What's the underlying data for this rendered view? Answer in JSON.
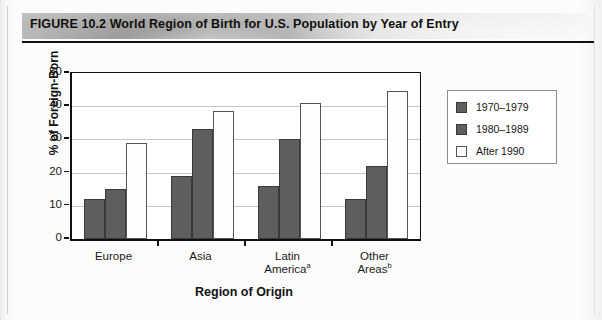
{
  "figure": {
    "title": "FIGURE 10.2 World Region of Birth for U.S. Population by Year of Entry"
  },
  "chart_data": {
    "type": "bar",
    "title": "World Region of Birth for U.S. Population by Year of Entry",
    "xlabel": "Region of Origin",
    "ylabel": "% of Foreign-Born",
    "ylim": [
      0,
      50
    ],
    "yticks": [
      0,
      10,
      20,
      30,
      40,
      50
    ],
    "grid": true,
    "legend_position": "right",
    "categories": [
      "Europe",
      "Asia",
      "Latin America",
      "Other Areas"
    ],
    "category_footnotes": [
      "",
      "",
      "a",
      "b"
    ],
    "series": [
      {
        "name": "1970–1979",
        "color": "#5e5e5e",
        "values": [
          12,
          19,
          16,
          12
        ]
      },
      {
        "name": "1980–1989",
        "color": "#5e5e5e",
        "values": [
          15,
          33,
          30,
          22
        ]
      },
      {
        "name": "After 1990",
        "color": "#ffffff",
        "values": [
          29,
          38.5,
          41,
          44.5
        ]
      }
    ]
  }
}
